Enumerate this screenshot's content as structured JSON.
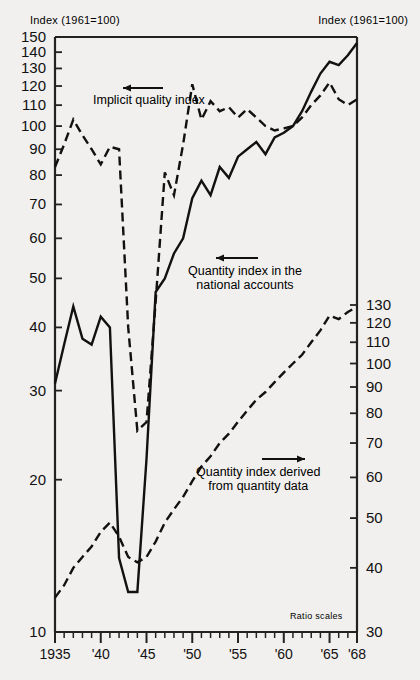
{
  "header": {
    "left_title": "Index (1961=100)",
    "right_title": "Index (1961=100)"
  },
  "annotations": {
    "ratio_scales": "Ratio scales",
    "implicit_label": "Implicit quality index",
    "national_label_line1": "Quantity index in the",
    "national_label_line2": "national accounts",
    "derived_label_line1": "Quantity index derived",
    "derived_label_line2": "from quantity data",
    "implicit_arrow": "arrow-left-icon",
    "national_arrow": "arrow-left-icon",
    "derived_arrow": "arrow-right-icon"
  },
  "chart_data": {
    "type": "line",
    "title": "Index (1961=100)",
    "xlabel": "",
    "ylabel": "Index (1961=100)",
    "scale": "log",
    "grid": false,
    "legend": "inline-annotations",
    "x_axis": {
      "min": 1935,
      "max": 1968,
      "tick_labels": [
        "1935",
        "'40",
        "'45",
        "'50",
        "'55",
        "'60",
        "'65",
        "'68"
      ],
      "tick_values": [
        1935,
        1940,
        1945,
        1950,
        1955,
        1960,
        1965,
        1968
      ],
      "minor_tick_interval": 1
    },
    "y_axis_left": {
      "scale": "log",
      "min": 10,
      "max": 150,
      "tick_values": [
        10,
        20,
        30,
        40,
        50,
        60,
        70,
        80,
        90,
        100,
        110,
        120,
        130,
        140,
        150
      ],
      "tick_labels": [
        "10",
        "20",
        "30",
        "40",
        "50",
        "60",
        "70",
        "80",
        "90",
        "100",
        "110",
        "120",
        "130",
        "140",
        "150"
      ]
    },
    "y_axis_right": {
      "scale": "log",
      "min": 30,
      "max": 130,
      "tick_values": [
        30,
        40,
        50,
        60,
        70,
        80,
        90,
        100,
        110,
        120,
        130
      ],
      "tick_labels": [
        "30",
        "40",
        "50",
        "60",
        "70",
        "80",
        "90",
        "100",
        "110",
        "120",
        "130"
      ]
    },
    "series": [
      {
        "name": "Implicit quality index",
        "axis": "left",
        "style": "dashed",
        "x": [
          1935,
          1936,
          1937,
          1938,
          1939,
          1940,
          1941,
          1942,
          1943,
          1944,
          1945,
          1946,
          1947,
          1948,
          1949,
          1950,
          1951,
          1952,
          1953,
          1954,
          1955,
          1956,
          1957,
          1958,
          1959,
          1960,
          1961,
          1962,
          1963,
          1964,
          1965,
          1966,
          1967,
          1968
        ],
        "values": [
          83,
          92,
          103,
          96,
          90,
          84,
          91,
          90,
          40,
          25,
          26,
          45,
          81,
          73,
          92,
          121,
          103,
          112,
          107,
          109,
          104,
          108,
          104,
          100,
          98,
          99,
          100,
          104,
          110,
          115,
          122,
          113,
          110,
          113
        ]
      },
      {
        "name": "Quantity index in the national accounts",
        "axis": "left",
        "style": "solid",
        "x": [
          1935,
          1936,
          1937,
          1938,
          1939,
          1940,
          1941,
          1942,
          1943,
          1944,
          1945,
          1946,
          1947,
          1948,
          1949,
          1950,
          1951,
          1952,
          1953,
          1954,
          1955,
          1956,
          1957,
          1958,
          1959,
          1960,
          1961,
          1962,
          1963,
          1964,
          1965,
          1966,
          1967,
          1968
        ],
        "values": [
          31,
          37,
          44,
          38,
          37,
          42,
          40,
          14,
          12,
          12,
          22,
          47,
          50,
          56,
          60,
          72,
          78,
          73,
          83,
          79,
          87,
          90,
          93,
          88,
          95,
          97,
          100,
          107,
          117,
          127,
          134,
          132,
          138,
          146
        ]
      },
      {
        "name": "Quantity index derived from quantity data",
        "axis": "right",
        "style": "dashed",
        "x": [
          1935,
          1936,
          1937,
          1938,
          1939,
          1940,
          1941,
          1942,
          1943,
          1944,
          1945,
          1946,
          1947,
          1948,
          1949,
          1950,
          1951,
          1952,
          1953,
          1954,
          1955,
          1956,
          1957,
          1958,
          1959,
          1960,
          1961,
          1962,
          1963,
          1964,
          1965,
          1966,
          1967,
          1968
        ],
        "values": [
          35,
          37,
          40,
          42,
          44,
          47,
          49,
          46,
          42,
          41,
          42,
          45,
          49,
          52,
          55,
          59,
          63,
          66,
          70,
          73,
          77,
          81,
          85,
          88,
          92,
          96,
          100,
          104,
          110,
          116,
          124,
          122,
          126,
          129
        ]
      }
    ]
  }
}
